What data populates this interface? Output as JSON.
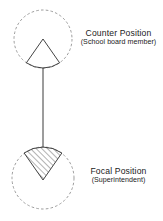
{
  "figure": {
    "type": "node-link-diagram",
    "background_color": "#ffffff",
    "stroke_color": "#3a3a3a",
    "dashed_stroke_color": "#8a8a8a",
    "hatch_color": "#4a4a4a",
    "nodes": [
      {
        "id": "counter",
        "title": "Counter Position",
        "subtitle": "(School board member)",
        "circle": {
          "cx": 43,
          "cy": 39,
          "r": 29
        },
        "wedge": {
          "orientation": "apex-up",
          "apex_x": 43,
          "apex_y": 39,
          "radius": 29,
          "start_angle_deg": 235,
          "end_angle_deg": 305,
          "fill": "none",
          "hatched": false
        },
        "label_position": "right"
      },
      {
        "id": "focal",
        "title": "Focal Position",
        "subtitle": "(Superintendent)",
        "circle": {
          "cx": 43,
          "cy": 178,
          "r": 31
        },
        "wedge": {
          "orientation": "apex-down",
          "apex_x": 43,
          "apex_y": 180,
          "radius": 33,
          "start_angle_deg": 55,
          "end_angle_deg": 125,
          "fill": "hatched",
          "hatched": true,
          "hatch_angle_deg": 45
        },
        "label_position": "right"
      }
    ],
    "connector": {
      "from_node": "counter",
      "to_node": "focal",
      "x": 43,
      "y_start": 68,
      "y_end": 147,
      "style": "solid"
    }
  }
}
